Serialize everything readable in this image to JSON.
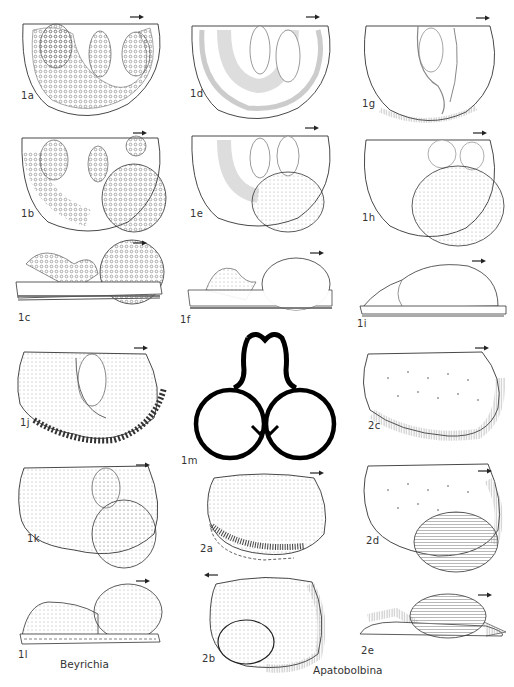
{
  "plate": {
    "figures": [
      {
        "id": "1a",
        "label": "1a",
        "view": "lateral, ornamented",
        "arrow": "right"
      },
      {
        "id": "1b",
        "label": "1b",
        "view": "lateral, with brood pouch",
        "arrow": "right"
      },
      {
        "id": "1c",
        "label": "1c",
        "view": "ventral/side profile",
        "arrow": "right"
      },
      {
        "id": "1d",
        "label": "1d",
        "view": "lateral, smooth lobes",
        "arrow": "right"
      },
      {
        "id": "1e",
        "label": "1e",
        "view": "lateral, with brood pouch",
        "arrow": "right"
      },
      {
        "id": "1f",
        "label": "1f",
        "view": "side profile",
        "arrow": "right"
      },
      {
        "id": "1g",
        "label": "1g",
        "view": "lateral, smooth",
        "arrow": "right"
      },
      {
        "id": "1h",
        "label": "1h",
        "view": "lateral, with brood pouch",
        "arrow": "right"
      },
      {
        "id": "1i",
        "label": "1i",
        "view": "side profile",
        "arrow": "right"
      },
      {
        "id": "1j",
        "label": "1j",
        "view": "lateral, spinose margin",
        "arrow": "right"
      },
      {
        "id": "1k",
        "label": "1k",
        "view": "lateral, with brood pouch",
        "arrow": "right"
      },
      {
        "id": "1l",
        "label": "1l",
        "view": "side profile",
        "arrow": "right"
      },
      {
        "id": "1m",
        "label": "1m",
        "view": "cross-section",
        "arrow": ""
      },
      {
        "id": "2a",
        "label": "2a",
        "view": "lateral",
        "arrow": "right"
      },
      {
        "id": "2b",
        "label": "2b",
        "view": "lateral, with pouch",
        "arrow": "left"
      },
      {
        "id": "2c",
        "label": "2c",
        "view": "lateral",
        "arrow": "right"
      },
      {
        "id": "2d",
        "label": "2d",
        "view": "lateral, striate pouch",
        "arrow": "right"
      },
      {
        "id": "2e",
        "label": "2e",
        "view": "side profile",
        "arrow": "right"
      }
    ],
    "genera": {
      "beyrichia": "Beyrichia",
      "apatobolbina": "Apatobolbina"
    }
  }
}
